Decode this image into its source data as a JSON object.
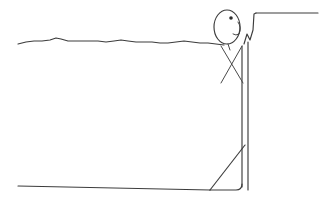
{
  "scene": {
    "title": "Stick figure at the edge of a drained pool",
    "style": "xkcd-style black-and-white line drawing",
    "background_color": "#ffffff",
    "ink_color": "#3c3c3c",
    "width": 320,
    "height": 207
  },
  "elements": {
    "water_surface": {
      "name": "wavy water line",
      "description": "Hand-drawn wavy horizontal line representing the water surface",
      "start_x": 18,
      "end_x": 222,
      "base_y": 43,
      "path": "M18,44 L26,42 L34,41 L42,41 L50,40 L56,38 L61,39 L68,41 L78,41 L88,41 L98,41 L106,42 L114,41 L121,40 L128,41 L136,42 L144,42 L152,42 L160,43 L168,43 L176,42 L184,41 L192,42 L200,43 L208,43 L216,44 L224,45"
    },
    "head": {
      "name": "stick figure head",
      "shape": "ellipse",
      "center_x": 227,
      "center_y": 27,
      "radius_x": 13,
      "radius_y": 17
    },
    "eye": {
      "name": "eye dot",
      "center_x": 231,
      "center_y": 18,
      "radius": 1.8
    },
    "neck": {
      "name": "neck line",
      "path": "M228,44 L230,50"
    },
    "arm_left": {
      "name": "crossed arm going down-right",
      "path": "M221,46 L243,83"
    },
    "arm_right": {
      "name": "crossed arm going down-left",
      "path": "M242,46 L221,83"
    },
    "ear_or_hand": {
      "name": "small hook detail at right of head",
      "path": "M238,22 Q242,28 239,34 Q236,36 233,34"
    },
    "body_front": {
      "name": "front body vertical line",
      "path": "M242,46 L242,187"
    },
    "body_back": {
      "name": "back body vertical line",
      "path": "M248,42 L248,190"
    },
    "pool_wall_step": {
      "name": "ledge rising from pool edge",
      "path": "M244,44 L247,34 L250,40 L253,30 L254,14 L256,13"
    },
    "ledge_top": {
      "name": "horizontal ledge surface extending right",
      "path": "M256,13 L318,13"
    },
    "pool_floor": {
      "name": "pool floor bottom line",
      "path": "M18,186 L210,190"
    },
    "pool_slope": {
      "name": "diagonal sloping pool wall",
      "path": "M210,190 L245,145"
    },
    "pool_bottom_corner": {
      "name": "rounded bottom corner of pool wall",
      "path": "M242,184 Q242,190 236,190 L210,190"
    }
  }
}
